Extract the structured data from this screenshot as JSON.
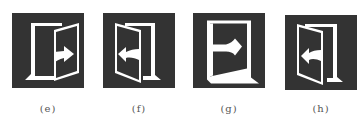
{
  "figure": {
    "panels": [
      {
        "id": "e",
        "label": "(e)",
        "icon": "exit-door-right-arrow-icon",
        "door_hinge": "right",
        "arrow_direction": "right"
      },
      {
        "id": "f",
        "label": "(f)",
        "icon": "enter-door-left-arrow-icon",
        "door_hinge": "left",
        "arrow_direction": "left"
      },
      {
        "id": "g",
        "label": "(g)",
        "icon": "exit-door-right-arrow-icon",
        "door_hinge": "left",
        "arrow_direction": "right"
      },
      {
        "id": "h",
        "label": "(h)",
        "icon": "enter-door-left-arrow-icon",
        "door_hinge": "left",
        "arrow_direction": "left"
      }
    ],
    "colors": {
      "panel_background": "#333333",
      "icon_foreground": "#ffffff",
      "caption_text": "#555555"
    }
  }
}
